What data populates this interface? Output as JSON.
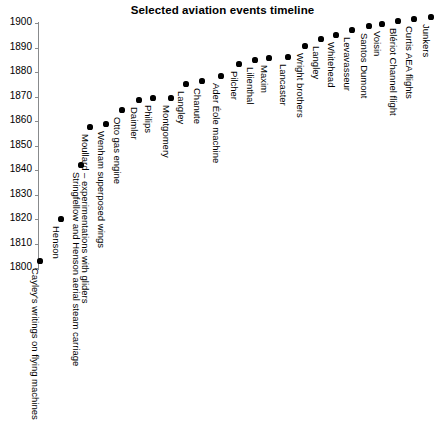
{
  "chart_data": {
    "type": "scatter",
    "title": "Selected aviation events timeline",
    "xlabel": "",
    "ylabel": "",
    "ylim": [
      1800,
      1900
    ],
    "yticks": [
      1800,
      1810,
      1820,
      1830,
      1840,
      1850,
      1860,
      1870,
      1880,
      1890,
      1900
    ],
    "ytick_labels": [
      "1800",
      "1810",
      "1820",
      "1830",
      "1840",
      "1850",
      "1860",
      "1870",
      "1880",
      "1890",
      "1900"
    ],
    "grid": false,
    "legend": null,
    "marker_color": "#000000",
    "axis_color": "#888a8c",
    "categories": [
      "Cayley's writings on flying machines",
      "Henson",
      "Stringfellow and Henson aerial steam carriage",
      "Moullard – experimentations with gliders",
      "Wenham superposed wings",
      "Otto gas engine",
      "Daimler",
      "Philips",
      "Montgomery",
      "Langley",
      "Chanute",
      "Ader Éole machine",
      "Pilcher",
      "Lilienthal",
      "Maxim",
      "Lancaster",
      "Wright brothers",
      "Langley",
      "Whitehead",
      "Levavasseur",
      "Santos Dumont",
      "Voisin",
      "Blériot Channel flight",
      "Curtis AEA flights",
      "Junkers"
    ],
    "values": [
      1803,
      1820,
      1843,
      1858,
      1859,
      1866,
      1885,
      1886,
      1886,
      1892,
      1893,
      1894,
      1899,
      1897,
      1894,
      1894,
      1901,
      1903,
      1901,
      1903,
      1905,
      1906,
      1908,
      1908,
      1909
    ]
  },
  "points": [
    {
      "label": "Cayley's writings on flying machines",
      "year": "1803",
      "x": 40,
      "y": 261
    },
    {
      "label": "Henson",
      "year": "1820",
      "x": 61,
      "y": 219
    },
    {
      "label": "Stringfellow and Henson aerial steam carriage",
      "year": "1843",
      "x": 81,
      "y": 165
    },
    {
      "label": "Moullard – experimentations with gliders",
      "year": "1858",
      "x": 90,
      "y": 127
    },
    {
      "label": "Wenham superposed wings",
      "year": "1859",
      "x": 106,
      "y": 124
    },
    {
      "label": "Otto gas engine",
      "year": "1866",
      "x": 122,
      "y": 110
    },
    {
      "label": "Daimler",
      "year": "1885",
      "x": 139,
      "y": 100
    },
    {
      "label": "Philips",
      "year": "1886",
      "x": 153,
      "y": 98
    },
    {
      "label": "Montgomery",
      "year": "1886",
      "x": 171,
      "y": 98
    },
    {
      "label": "Langley",
      "year": "1892",
      "x": 186,
      "y": 84
    },
    {
      "label": "Chanute",
      "year": "1893",
      "x": 202,
      "y": 81
    },
    {
      "label": "Ader Éole machine",
      "year": "1894",
      "x": 221,
      "y": 76
    },
    {
      "label": "Pilcher",
      "year": "1899",
      "x": 239,
      "y": 64
    },
    {
      "label": "Lilienthal",
      "year": "1897",
      "x": 255,
      "y": 60
    },
    {
      "label": "Maxim",
      "year": "1894",
      "x": 269,
      "y": 58
    },
    {
      "label": "Lancaster",
      "year": "1894",
      "x": 288,
      "y": 57
    },
    {
      "label": "Wright brothers",
      "year": "1901",
      "x": 305,
      "y": 46
    },
    {
      "label": "Langley",
      "year": "1903",
      "x": 321,
      "y": 39
    },
    {
      "label": "Whitehead",
      "year": "1901",
      "x": 336,
      "y": 35
    },
    {
      "label": "Levavasseur",
      "year": "1903",
      "x": 352,
      "y": 30
    },
    {
      "label": "Santos Dumont",
      "year": "1905",
      "x": 369,
      "y": 26
    },
    {
      "label": "Voisin",
      "year": "1906",
      "x": 382,
      "y": 24
    },
    {
      "label": "Blériot Channel flight",
      "year": "1908",
      "x": 398,
      "y": 21
    },
    {
      "label": "Curtis AEA flights",
      "year": "1908",
      "x": 414,
      "y": 19
    },
    {
      "label": "Junkers",
      "year": "1909",
      "x": 431,
      "y": 17
    }
  ],
  "yaxis": {
    "ticks": [
      {
        "label": "1900",
        "y": 23
      },
      {
        "label": "1890",
        "y": 47.5
      },
      {
        "label": "1880",
        "y": 72
      },
      {
        "label": "1870",
        "y": 96.5
      },
      {
        "label": "1850",
        "y": 145.5
      },
      {
        "label": "1860",
        "y": 121
      },
      {
        "label": "1840",
        "y": 170
      },
      {
        "label": "1830",
        "y": 194.5
      },
      {
        "label": "1820",
        "y": 219
      },
      {
        "label": "1810",
        "y": 243.5
      },
      {
        "label": "1800",
        "y": 268
      }
    ]
  }
}
